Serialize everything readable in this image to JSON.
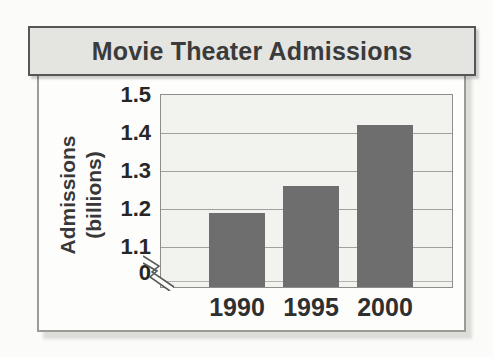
{
  "title": "Movie Theater Admissions",
  "chart_data": {
    "type": "bar",
    "title": "Movie Theater Admissions",
    "categories": [
      "1990",
      "1995",
      "2000"
    ],
    "values": [
      1.19,
      1.26,
      1.42
    ],
    "xlabel": "",
    "ylabel": "Admissions (billions)",
    "ylabel_lines": [
      "Admissions",
      "(billions)"
    ],
    "y_ticks": [
      1.5,
      1.4,
      1.3,
      1.2,
      1.1
    ],
    "zero_tick_label": "0",
    "ylim": [
      1.1,
      1.5
    ],
    "axis_break": true,
    "grid": true,
    "legend": "none",
    "bar_color": "#6e6e6e",
    "plot_bg": "#f2f2ef",
    "title_bar_bg": "#e4e4e1",
    "gridline_color": "#a0a09d",
    "text_color": "#2f2f2f"
  }
}
